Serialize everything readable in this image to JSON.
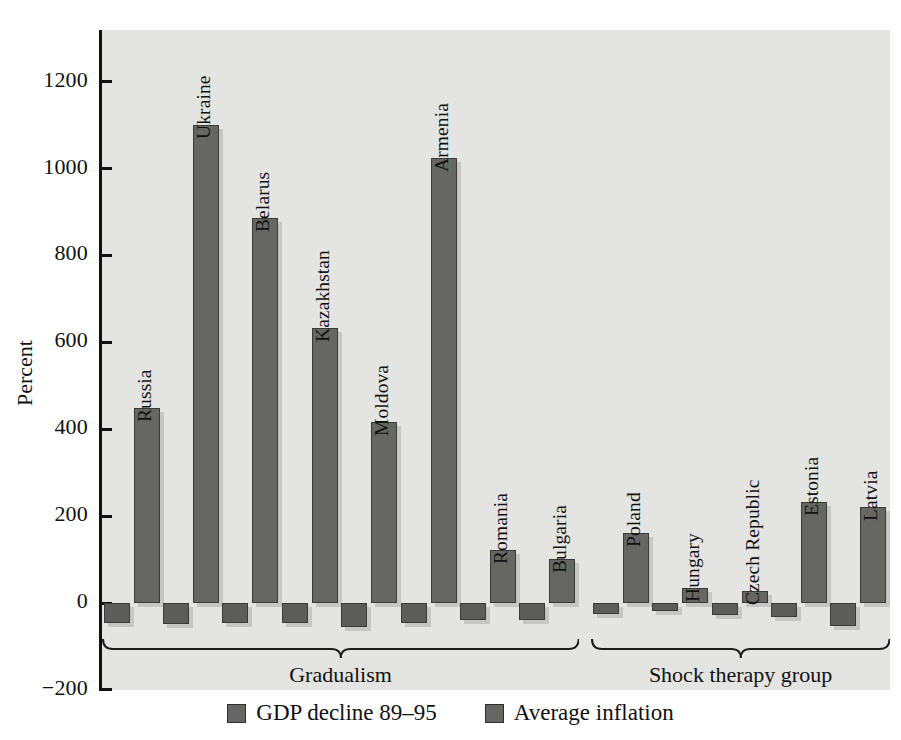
{
  "chart_data": {
    "type": "bar",
    "title": "",
    "xlabel": "",
    "ylabel": "Percent",
    "ylim": [
      -200,
      1300
    ],
    "yticks": [
      1200,
      1000,
      800,
      600,
      400,
      200,
      0,
      -200
    ],
    "ytick_labels": [
      "1200",
      "1000",
      "800",
      "600",
      "400",
      "200",
      "0",
      "−200"
    ],
    "grid": false,
    "legend_position": "bottom-center",
    "categories": [
      "Russia",
      "Ukraine",
      "Belarus",
      "Kazakhstan",
      "Moldova",
      "Armenia",
      "Romania",
      "Bulgaria",
      "Poland",
      "Hungary",
      "Czech Republic",
      "Estonia",
      "Latvia"
    ],
    "series": [
      {
        "name": "GDP decline 89–95",
        "color": "#5c5c59",
        "values": [
          -45,
          -48,
          -45,
          -47,
          -55,
          -45,
          -38,
          -40,
          -25,
          -18,
          -28,
          -32,
          -52
        ]
      },
      {
        "name": "Average inflation",
        "color": "#666663",
        "values": [
          448,
          1101,
          887,
          634,
          416,
          1025,
          122,
          101,
          161,
          34,
          28,
          232,
          221
        ]
      }
    ],
    "group_annotations": [
      {
        "label": "Gradualism",
        "from": "Russia",
        "to": "Bulgaria"
      },
      {
        "label": "Shock therapy group",
        "from": "Poland",
        "to": "Latvia"
      }
    ]
  },
  "legend": {
    "items": [
      {
        "label": "GDP decline 89–95"
      },
      {
        "label": "Average inflation"
      }
    ]
  }
}
